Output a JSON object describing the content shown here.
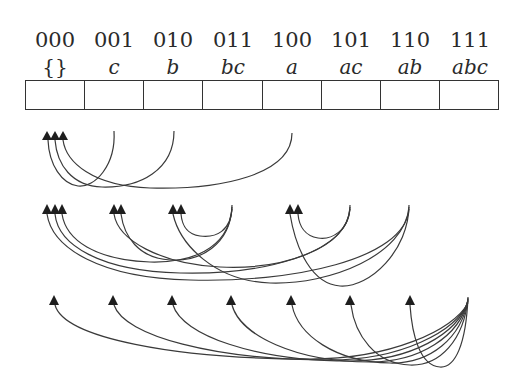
{
  "diagram": {
    "type": "subset-lattice-array",
    "cells": [
      {
        "index": 0,
        "bits": "000",
        "set": "{}"
      },
      {
        "index": 1,
        "bits": "001",
        "set": "c"
      },
      {
        "index": 2,
        "bits": "010",
        "set": "b"
      },
      {
        "index": 3,
        "bits": "011",
        "set": "bc"
      },
      {
        "index": 4,
        "bits": "100",
        "set": "a"
      },
      {
        "index": 5,
        "bits": "101",
        "set": "ac"
      },
      {
        "index": 6,
        "bits": "110",
        "set": "ab"
      },
      {
        "index": 7,
        "bits": "111",
        "set": "abc"
      }
    ],
    "rows": [
      {
        "name": "singletons-to-empty",
        "edges": [
          {
            "from": "001",
            "to": "000"
          },
          {
            "from": "010",
            "to": "000"
          },
          {
            "from": "100",
            "to": "000"
          }
        ]
      },
      {
        "name": "pairs-to-subsets",
        "edges": [
          {
            "from": "011",
            "to": "000"
          },
          {
            "from": "011",
            "to": "001"
          },
          {
            "from": "011",
            "to": "010"
          },
          {
            "from": "101",
            "to": "000"
          },
          {
            "from": "101",
            "to": "001"
          },
          {
            "from": "101",
            "to": "100"
          },
          {
            "from": "110",
            "to": "000"
          },
          {
            "from": "110",
            "to": "010"
          },
          {
            "from": "110",
            "to": "100"
          }
        ]
      },
      {
        "name": "full-set-to-all",
        "edges": [
          {
            "from": "111",
            "to": "000"
          },
          {
            "from": "111",
            "to": "001"
          },
          {
            "from": "111",
            "to": "010"
          },
          {
            "from": "111",
            "to": "011"
          },
          {
            "from": "111",
            "to": "100"
          },
          {
            "from": "111",
            "to": "101"
          },
          {
            "from": "111",
            "to": "110"
          }
        ]
      }
    ],
    "colors": {
      "stroke": "#3a3a3a",
      "arrowhead": "#1e1e1e",
      "background": "#ffffff"
    }
  }
}
